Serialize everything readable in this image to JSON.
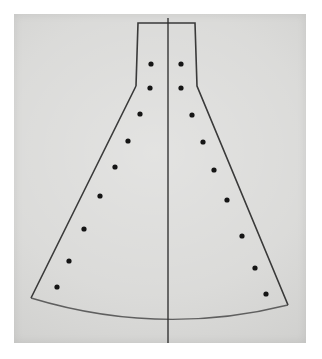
{
  "figure": {
    "name": "flared-pattern-drawing",
    "medium": "photograph of pen drawing on paper"
  },
  "canvas": {
    "width": 322,
    "height": 359,
    "background_color": "#ffffff"
  },
  "paper": {
    "left": 14,
    "top": 14,
    "width": 292,
    "height": 329,
    "color": "#d7d7d5"
  },
  "colors": {
    "ink": "#2b2b2b",
    "hem_ink": "#4a4a4a",
    "dot": "#151515",
    "paper": "#d7d7d5",
    "border": "#ffffff"
  },
  "geometry": {
    "outline_points": [
      {
        "x": 138,
        "y": 23
      },
      {
        "x": 195,
        "y": 23
      },
      {
        "x": 197,
        "y": 86
      },
      {
        "x": 288,
        "y": 305
      },
      {
        "x": 31,
        "y": 298
      },
      {
        "x": 136,
        "y": 86
      }
    ],
    "top_edge": {
      "x1": 138,
      "y1": 23,
      "x2": 195,
      "y2": 23
    },
    "left_neck": {
      "x1": 138,
      "y1": 23,
      "x2": 136,
      "y2": 86
    },
    "right_neck": {
      "x1": 195,
      "y1": 23,
      "x2": 197,
      "y2": 86
    },
    "left_flare": {
      "x1": 136,
      "y1": 86,
      "x2": 31,
      "y2": 298
    },
    "right_flare": {
      "x1": 197,
      "y1": 86,
      "x2": 288,
      "y2": 305
    },
    "hem_curve": {
      "start": {
        "x": 31,
        "y": 298
      },
      "control": {
        "x": 160,
        "y": 337
      },
      "end": {
        "x": 288,
        "y": 305
      }
    },
    "center_axis": {
      "x": 168,
      "y_top": 18,
      "y_bottom": 343
    },
    "hem_crossing": {
      "x": 168,
      "y": 324
    }
  },
  "markers": {
    "count": 18,
    "radius": 2.6,
    "left_column": [
      {
        "index": 1,
        "x": 151,
        "y": 64
      },
      {
        "index": 2,
        "x": 150,
        "y": 88
      },
      {
        "index": 3,
        "x": 140,
        "y": 114
      },
      {
        "index": 4,
        "x": 128,
        "y": 141
      },
      {
        "index": 5,
        "x": 115,
        "y": 167
      },
      {
        "index": 6,
        "x": 100,
        "y": 196
      },
      {
        "index": 7,
        "x": 84,
        "y": 229
      },
      {
        "index": 8,
        "x": 69,
        "y": 261
      },
      {
        "index": 9,
        "x": 57,
        "y": 287
      }
    ],
    "right_column": [
      {
        "index": 1,
        "x": 181,
        "y": 64
      },
      {
        "index": 2,
        "x": 181,
        "y": 88
      },
      {
        "index": 3,
        "x": 192,
        "y": 115
      },
      {
        "index": 4,
        "x": 203,
        "y": 142
      },
      {
        "index": 5,
        "x": 214,
        "y": 170
      },
      {
        "index": 6,
        "x": 227,
        "y": 200
      },
      {
        "index": 7,
        "x": 242,
        "y": 236
      },
      {
        "index": 8,
        "x": 255,
        "y": 268
      },
      {
        "index": 9,
        "x": 266,
        "y": 294
      }
    ]
  }
}
